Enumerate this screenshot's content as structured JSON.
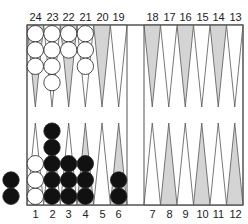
{
  "board": {
    "top_labels_left": [
      "24",
      "23",
      "22",
      "21",
      "20",
      "19"
    ],
    "top_labels_right": [
      "18",
      "17",
      "16",
      "15",
      "14",
      "13"
    ],
    "bottom_labels_left": [
      "1",
      "2",
      "3",
      "4",
      "5",
      "6"
    ],
    "bottom_labels_right": [
      "7",
      "8",
      "9",
      "10",
      "11",
      "12"
    ],
    "colors": {
      "shaded_point": "#d4d4d4",
      "line": "#555555",
      "black_checker": "#111111",
      "white_checker": "#ffffff"
    },
    "shaded_points": [
      24,
      22,
      20,
      18,
      16,
      14,
      4,
      6,
      8,
      10,
      12
    ],
    "checkers": [
      {
        "point": 24,
        "color": "white",
        "count": 3
      },
      {
        "point": 23,
        "color": "white",
        "count": 4
      },
      {
        "point": 22,
        "color": "white",
        "count": 2
      },
      {
        "point": 21,
        "color": "white",
        "count": 3
      },
      {
        "point": 1,
        "color": "white",
        "count": 3
      },
      {
        "point": 2,
        "color": "black",
        "count": 5
      },
      {
        "point": 3,
        "color": "black",
        "count": 3
      },
      {
        "point": 4,
        "color": "black",
        "count": 3
      },
      {
        "point": 6,
        "color": "black",
        "count": 2
      }
    ],
    "borne_off": {
      "color": "black",
      "count": 2
    }
  }
}
